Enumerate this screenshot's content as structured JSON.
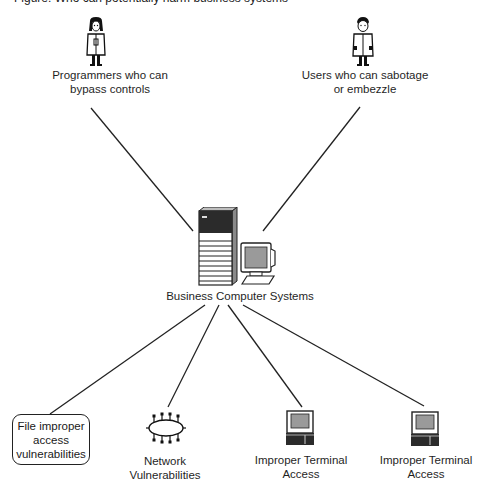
{
  "caption": {
    "text": "Figure: Who can potentially harm business systems"
  },
  "nodes": {
    "programmers": {
      "label_line1": "Programmers who can",
      "label_line2": "bypass controls",
      "icon": "female-person-icon"
    },
    "users": {
      "label_line1": "Users who can sabotage",
      "label_line2": "or embezzle",
      "icon": "male-person-icon"
    },
    "center": {
      "label": "Business Computer Systems",
      "icon": "server-and-monitor-icon"
    },
    "file": {
      "label_line1": "File improper",
      "label_line2": "access",
      "label_line3": "vulnerabilities"
    },
    "network": {
      "label_line1": "Network",
      "label_line2": "Vulnerabilities",
      "icon": "network-ring-icon"
    },
    "terminal1": {
      "label_line1": "Improper Terminal",
      "label_line2": "Access",
      "icon": "terminal-icon"
    },
    "terminal2": {
      "label_line1": "Improper Terminal",
      "label_line2": "Access",
      "icon": "terminal-icon"
    }
  },
  "colors": {
    "line": "#222222",
    "screen_fill": "#9a9a9a",
    "server_dark": "#2b2b2b"
  }
}
